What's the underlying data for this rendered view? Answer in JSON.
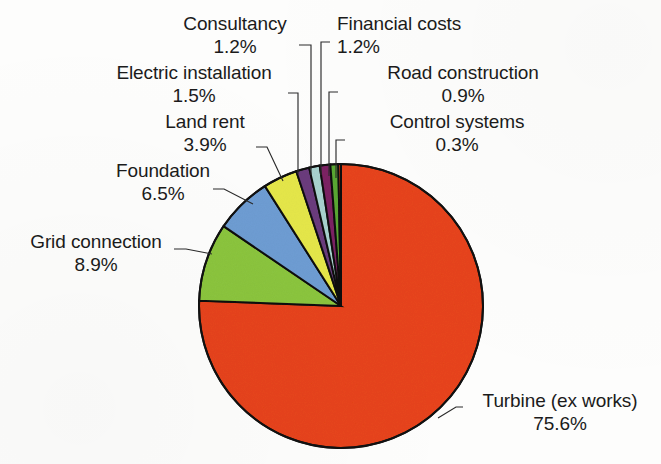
{
  "chart_data": {
    "type": "pie",
    "title": "",
    "subtitle": "",
    "xlabel": "",
    "ylabel": "",
    "legend_position": "callout-labels",
    "grid": false,
    "units": "percent",
    "total": 100.0,
    "start_angle_deg": 0,
    "direction": "clockwise",
    "categories": [
      "Turbine (ex works)",
      "Grid connection",
      "Foundation",
      "Land rent",
      "Electric installation",
      "Consultancy",
      "Financial costs",
      "Road construction",
      "Control systems"
    ],
    "values": [
      75.6,
      8.9,
      6.5,
      3.9,
      1.5,
      1.2,
      1.2,
      0.9,
      0.3
    ],
    "colors": [
      "#e8441a",
      "#8cc63f",
      "#6f9ed4",
      "#e6e84a",
      "#6b3b7d",
      "#a9d3cf",
      "#7c2063",
      "#5aa832",
      "#e8441a"
    ],
    "slices": [
      {
        "label": "Turbine (ex works)",
        "value": 75.6,
        "display": "75.6%",
        "color": "#e8441a"
      },
      {
        "label": "Grid connection",
        "value": 8.9,
        "display": "8.9%",
        "color": "#8cc63f"
      },
      {
        "label": "Foundation",
        "value": 6.5,
        "display": "6.5%",
        "color": "#6f9ed4"
      },
      {
        "label": "Land rent",
        "value": 3.9,
        "display": "3.9%",
        "color": "#e6e84a"
      },
      {
        "label": "Electric installation",
        "value": 1.5,
        "display": "1.5%",
        "color": "#6b3b7d"
      },
      {
        "label": "Consultancy",
        "value": 1.2,
        "display": "1.2%",
        "color": "#a9d3cf"
      },
      {
        "label": "Financial costs",
        "value": 1.2,
        "display": "1.2%",
        "color": "#7c2063"
      },
      {
        "label": "Road construction",
        "value": 0.9,
        "display": "0.9%",
        "color": "#5aa832"
      },
      {
        "label": "Control systems",
        "value": 0.3,
        "display": "0.3%",
        "color": "#e8441a"
      }
    ]
  },
  "labels": {
    "consultancy": {
      "name": "Consultancy",
      "pct": "1.2%"
    },
    "electric": {
      "name": "Electric installation",
      "pct": "1.5%"
    },
    "landrent": {
      "name": "Land rent",
      "pct": "3.9%"
    },
    "foundation": {
      "name": "Foundation",
      "pct": "6.5%"
    },
    "grid": {
      "name": "Grid connection",
      "pct": "8.9%"
    },
    "financial": {
      "name": "Financial costs",
      "pct": "1.2%"
    },
    "road": {
      "name": "Road construction",
      "pct": "0.9%"
    },
    "control": {
      "name": "Control systems",
      "pct": "0.3%"
    },
    "turbine": {
      "name": "Turbine (ex works)",
      "pct": "75.6%"
    }
  },
  "palette": {
    "red": "#e8441a",
    "green": "#8cc63f",
    "blue": "#6f9ed4",
    "yellow": "#e6e84a",
    "purple": "#6b3b7d",
    "cyan": "#a9d3cf",
    "magenta": "#7c2063",
    "darkgreen": "#5aa832",
    "outline": "#111111",
    "text": "#1b1b1b",
    "background": "#fdfdfc"
  },
  "geometry": {
    "center_x": 341,
    "center_y": 306,
    "radius": 142
  }
}
